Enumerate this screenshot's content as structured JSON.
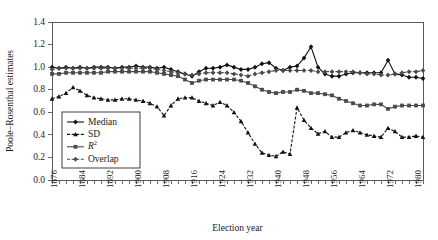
{
  "chart_data": {
    "type": "line",
    "title": "",
    "xlabel": "Election year",
    "ylabel": "Poole–Rosenthal estimates",
    "ylim": [
      0.0,
      1.4
    ],
    "ytick_labels": [
      "0.0",
      "0.2",
      "0.4",
      "0.6",
      "0.8",
      "1.0",
      "1.2",
      "1.4"
    ],
    "ytick_values": [
      0.0,
      0.2,
      0.4,
      0.6,
      0.8,
      1.0,
      1.2,
      1.4
    ],
    "xlim": [
      1876,
      1982
    ],
    "xtick_labels": [
      "1876",
      "1884",
      "1892",
      "1900",
      "1908",
      "1916",
      "1924",
      "1932",
      "1940",
      "1948",
      "1956",
      "1964",
      "1972",
      "1980"
    ],
    "xtick_values": [
      1876,
      1884,
      1892,
      1900,
      1908,
      1916,
      1924,
      1932,
      1940,
      1948,
      1956,
      1964,
      1972,
      1980
    ],
    "minor_tick_step": 2,
    "grid": false,
    "legend_position": "lower-left-inside",
    "x": [
      1876,
      1878,
      1880,
      1882,
      1884,
      1886,
      1888,
      1890,
      1892,
      1894,
      1896,
      1898,
      1900,
      1902,
      1904,
      1906,
      1908,
      1910,
      1912,
      1914,
      1916,
      1918,
      1920,
      1922,
      1924,
      1926,
      1928,
      1930,
      1932,
      1934,
      1936,
      1938,
      1940,
      1942,
      1944,
      1946,
      1948,
      1950,
      1952,
      1954,
      1956,
      1958,
      1960,
      1962,
      1964,
      1966,
      1968,
      1970,
      1972,
      1974,
      1976,
      1978,
      1980,
      1982
    ],
    "series": [
      {
        "name": "Median",
        "marker": "diamond",
        "dash": "solid",
        "color": "#111111",
        "values": [
          1.0,
          0.99,
          1.0,
          0.99,
          1.0,
          0.99,
          1.0,
          1.0,
          1.0,
          0.99,
          1.0,
          1.0,
          1.01,
          1.0,
          1.0,
          0.99,
          1.0,
          0.98,
          0.96,
          0.94,
          0.92,
          0.96,
          0.99,
          0.99,
          1.0,
          1.02,
          1.0,
          0.98,
          0.98,
          1.0,
          1.03,
          1.04,
          0.99,
          0.97,
          1.0,
          1.01,
          1.08,
          1.18,
          1.0,
          0.94,
          0.92,
          0.92,
          0.94,
          0.95,
          0.95,
          0.95,
          0.95,
          0.95,
          1.06,
          0.94,
          0.93,
          0.91,
          0.91,
          0.9
        ]
      },
      {
        "name": "SD",
        "marker": "triangle",
        "dash": "dashed",
        "color": "#111111",
        "values": [
          0.72,
          0.74,
          0.77,
          0.82,
          0.79,
          0.75,
          0.73,
          0.72,
          0.71,
          0.71,
          0.72,
          0.72,
          0.71,
          0.7,
          0.68,
          0.65,
          0.57,
          0.66,
          0.72,
          0.73,
          0.73,
          0.7,
          0.68,
          0.66,
          0.69,
          0.66,
          0.6,
          0.52,
          0.42,
          0.32,
          0.24,
          0.22,
          0.21,
          0.25,
          0.23,
          0.64,
          0.53,
          0.46,
          0.41,
          0.43,
          0.38,
          0.38,
          0.42,
          0.44,
          0.42,
          0.4,
          0.39,
          0.38,
          0.46,
          0.43,
          0.38,
          0.38,
          0.39,
          0.38
        ]
      },
      {
        "name": "R²",
        "marker": "square",
        "dash": "solid",
        "color": "#4a4a4a",
        "values": [
          0.94,
          0.94,
          0.95,
          0.95,
          0.95,
          0.95,
          0.95,
          0.95,
          0.96,
          0.96,
          0.96,
          0.96,
          0.96,
          0.96,
          0.96,
          0.95,
          0.94,
          0.93,
          0.92,
          0.89,
          0.86,
          0.88,
          0.89,
          0.89,
          0.89,
          0.89,
          0.89,
          0.88,
          0.86,
          0.83,
          0.8,
          0.78,
          0.77,
          0.78,
          0.78,
          0.8,
          0.79,
          0.77,
          0.77,
          0.76,
          0.75,
          0.72,
          0.7,
          0.68,
          0.66,
          0.66,
          0.67,
          0.67,
          0.63,
          0.65,
          0.66,
          0.66,
          0.66,
          0.66
        ]
      },
      {
        "name": "Overlap",
        "marker": "diamond",
        "dash": "dashed",
        "color": "#4a4a4a",
        "values": [
          0.98,
          0.99,
          0.99,
          0.99,
          0.99,
          0.99,
          0.99,
          0.99,
          0.99,
          0.99,
          0.99,
          0.99,
          0.99,
          0.99,
          0.99,
          0.98,
          0.97,
          0.96,
          0.95,
          0.94,
          0.93,
          0.94,
          0.95,
          0.95,
          0.95,
          0.95,
          0.94,
          0.93,
          0.92,
          0.94,
          0.95,
          0.96,
          0.97,
          0.97,
          0.97,
          0.97,
          0.97,
          0.97,
          0.96,
          0.96,
          0.96,
          0.96,
          0.96,
          0.96,
          0.95,
          0.94,
          0.94,
          0.93,
          0.93,
          0.94,
          0.95,
          0.96,
          0.96,
          0.97
        ]
      }
    ],
    "legend": [
      {
        "label": "Median",
        "marker": "diamond",
        "dash": "solid",
        "color": "#111111"
      },
      {
        "label": "SD",
        "marker": "triangle",
        "dash": "dashed",
        "color": "#111111"
      },
      {
        "label": "R",
        "sup": "2",
        "marker": "square",
        "dash": "solid",
        "color": "#4a4a4a"
      },
      {
        "label": "Overlap",
        "marker": "diamond",
        "dash": "dashed",
        "color": "#4a4a4a"
      }
    ]
  }
}
